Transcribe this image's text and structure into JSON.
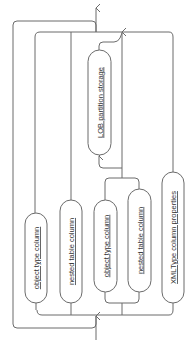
{
  "diagram": {
    "type": "railroad-syntax",
    "orientation": "rotated-90-ccw",
    "nodes": [
      {
        "id": "lob",
        "label": "LOB partition storage"
      },
      {
        "id": "obj1",
        "label": "object type column"
      },
      {
        "id": "nest1",
        "label": "nested table column"
      },
      {
        "id": "obj2",
        "label": "object type column"
      },
      {
        "id": "nest2",
        "label": "nested table column"
      },
      {
        "id": "xml",
        "label": "XMLType column properties"
      }
    ],
    "colors": {
      "line": "#6b6b6b",
      "text": "#333333",
      "background": "#ffffff"
    }
  }
}
